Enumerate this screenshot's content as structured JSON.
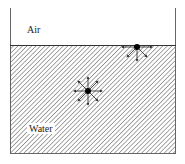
{
  "diagram": {
    "type": "surface-tension-molecular-forces",
    "regions": [
      {
        "name": "air",
        "label": "Air"
      },
      {
        "name": "water",
        "label": "Water"
      }
    ],
    "molecules": [
      {
        "name": "surface-molecule",
        "x": 137,
        "y": 47,
        "arrows": [
          "left",
          "right",
          "down-left",
          "down",
          "down-right"
        ]
      },
      {
        "name": "bulk-molecule",
        "x": 88,
        "y": 91,
        "arrows": [
          "up",
          "down",
          "left",
          "right",
          "up-left",
          "up-right",
          "down-left",
          "down-right"
        ]
      }
    ],
    "colors": {
      "outline": "#555555",
      "hatch": "#7a7a7a",
      "molecule": "#000000",
      "background": "#ffffff"
    }
  }
}
